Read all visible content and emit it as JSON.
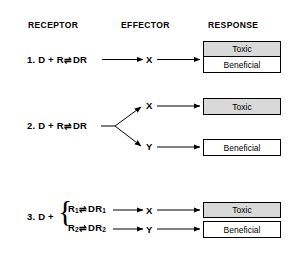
{
  "figure": {
    "headers": [
      {
        "label": "RECEPTOR",
        "x": 28,
        "y": 20
      },
      {
        "label": "EFFECTOR",
        "x": 121,
        "y": 20
      },
      {
        "label": "RESPONSE",
        "x": 208,
        "y": 20
      }
    ],
    "equilibrium_symbol": "⇌",
    "rows": [
      {
        "number": "1.",
        "receptor": "D + R ⇌ DR",
        "effectors": [
          "X"
        ],
        "responses": [
          "Toxic",
          "Beneficial"
        ],
        "shaded": [
          "Toxic"
        ]
      },
      {
        "number": "2.",
        "receptor": "D + R ⇌ DR",
        "effectors": [
          "X",
          "Y"
        ],
        "responses": [
          "Toxic",
          "Beneficial"
        ],
        "shaded": [
          "Toxic"
        ]
      },
      {
        "number": "3.",
        "receptor_prefix": "D +",
        "receptor_branches": [
          "R₁ ⇌ DR₁",
          "R₂ ⇌ DR₂"
        ],
        "effectors": [
          "X",
          "Y"
        ],
        "responses": [
          "Toxic",
          "Beneficial"
        ],
        "shaded": [
          "Toxic"
        ]
      }
    ],
    "labels": {
      "toxic": "Toxic",
      "beneficial": "Beneficial",
      "effector_x": "X",
      "effector_y": "Y",
      "row1_num": "1.",
      "row2_num": "2.",
      "row3_num": "3.",
      "row1_eq_left": "D + R",
      "row1_eq_right": "DR",
      "row2_eq_left": "D + R",
      "row2_eq_right": "DR",
      "row3_prefix": "D +",
      "row3_branch1_left": "R",
      "row3_branch1_sub1": "1",
      "row3_branch1_right": "DR",
      "row3_branch1_sub2": "1",
      "row3_branch2_left": "R",
      "row3_branch2_sub1": "2",
      "row3_branch2_right": "DR",
      "row3_branch2_sub2": "2",
      "brace": "{"
    },
    "colors": {
      "shaded_fill": "#d9d9d9",
      "box_border": "#000000",
      "line": "#000000",
      "background": "#ffffff"
    }
  }
}
